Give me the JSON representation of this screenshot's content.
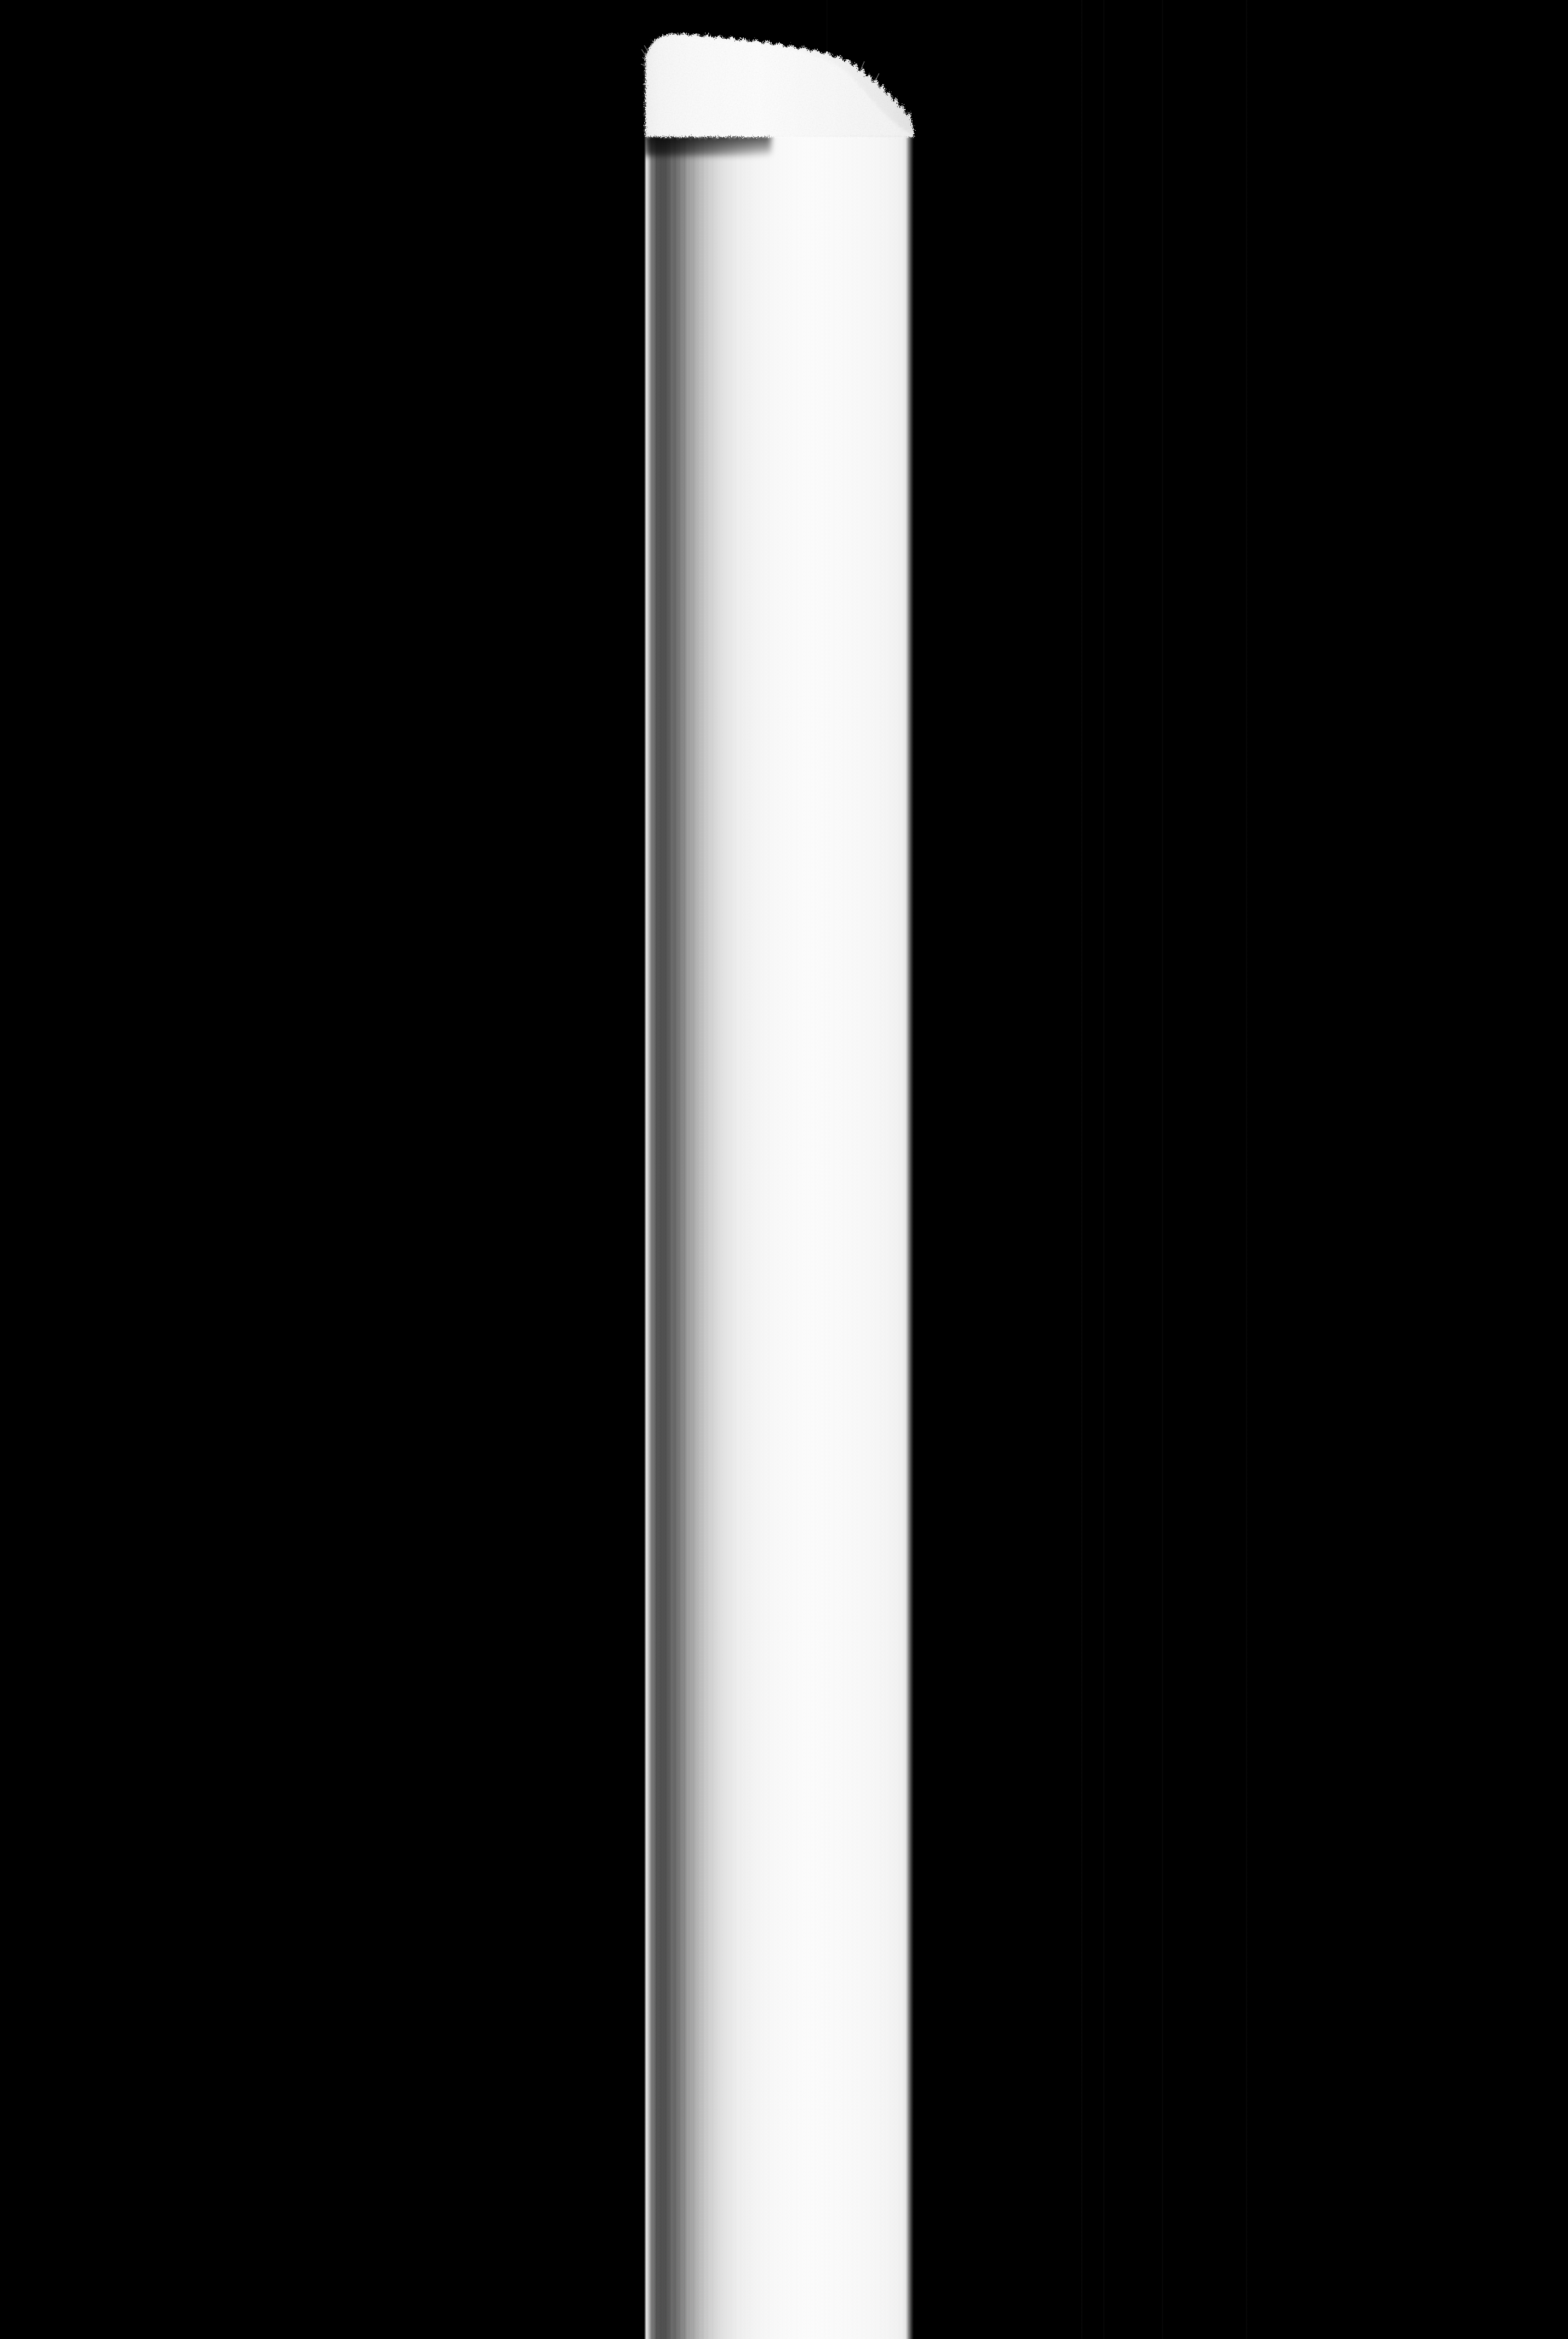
{
  "image": {
    "title": "Vertical white column on black background",
    "medium": "grayscale macro photograph",
    "orientation": "portrait",
    "width_px": 2351,
    "height_px": 3506,
    "background_color": "#000000",
    "subject_color": "#fbfbfb",
    "alt_text": "A tall narrow white cylindrical object lit against a pure black background, with a fibrous textured cap at the top, a thin dark band below the cap, and fine vertical motion-blur striations running the length of the shaft."
  },
  "subject": {
    "name": "vertical-column",
    "left_px": 966,
    "right_px": 1370,
    "width_px": 404,
    "top_px": 36,
    "bottom_px": 3506,
    "description": "cylindrical shaft extending from near the top of the frame to the bottom edge"
  },
  "parts": {
    "cap": {
      "label": "fibrous cap",
      "top_px": 36,
      "bottom_px": 192,
      "texture": "fuzzy, granular, hair-like fibers protruding from the silhouette",
      "profile": "highest at left, sloping gradually down toward the right with a notch near the right end",
      "color": "#f2f2f2"
    },
    "dark_band": {
      "label": "dark separator band",
      "top_px": 184,
      "bottom_px": 202,
      "description": "thin dark horizontal line beneath the cap, slightly tilted, heavily smeared at the left side",
      "color": "#2a2a2a"
    },
    "shaft": {
      "label": "cylindrical shaft",
      "top_px": 196,
      "bottom_px": 3506,
      "description": "smooth white cylinder with vertical striations; dark shaded band along the left edge and a bright specular highlight line at the extreme left margin",
      "highlight_edge_x_px": 969,
      "shadow_band_x_px": [
        975,
        1060
      ],
      "brightest_x_px": 1200
    }
  },
  "background_lines": {
    "label": "faint vertical scan lines in the black field",
    "color": "#0d0d0d",
    "x_positions_px": [
      1239,
      1621,
      1654,
      1742,
      1868
    ]
  },
  "tones": {
    "black": "#000000",
    "near_black": "#0d0d0d",
    "shadow_gray": "#4e4e4e",
    "mid_gray": "#969696",
    "light_gray": "#d7d7d7",
    "white": "#fbfbfb"
  }
}
